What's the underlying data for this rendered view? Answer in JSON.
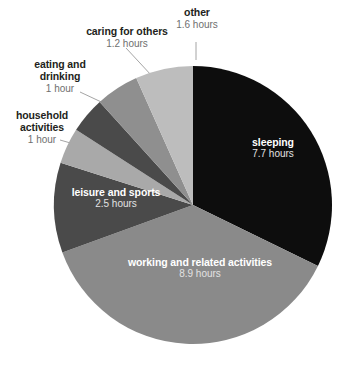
{
  "chart_data": {
    "type": "pie",
    "title": "",
    "subtitle": "",
    "unit": "hours",
    "total_hours": 23.9,
    "legend_position": "none",
    "grid": false,
    "start_angle_deg": 0,
    "direction": "clockwise",
    "categories": [
      "sleeping",
      "working and related activities",
      "leisure and sports",
      "household activities",
      "eating and drinking",
      "caring for others",
      "other"
    ],
    "values": [
      7.7,
      8.9,
      2.5,
      1,
      1,
      1.2,
      1.6
    ],
    "colors": [
      "#0d0d0d",
      "#8a8a8a",
      "#4a4a4a",
      "#a9a9a9",
      "#4a4a4a",
      "#8f8f8f",
      "#bdbdbd"
    ],
    "slices": [
      {
        "name": "sleeping",
        "value_label": "7.7 hours",
        "value": 7.7,
        "color": "#0d0d0d",
        "label_placement": "inside",
        "label_color": "#ffffff"
      },
      {
        "name": "working and related activities",
        "value_label": "8.9 hours",
        "value": 8.9,
        "color": "#8a8a8a",
        "label_placement": "inside",
        "label_color": "#ffffff"
      },
      {
        "name": "leisure and sports",
        "value_label": "2.5 hours",
        "value": 2.5,
        "color": "#4a4a4a",
        "label_placement": "inside",
        "label_color": "#ffffff"
      },
      {
        "name": "household activities",
        "value_label": "1 hour",
        "value": 1,
        "color": "#a9a9a9",
        "label_placement": "outside",
        "label_color": "#231f20"
      },
      {
        "name": "eating and drinking",
        "value_label": "1 hour",
        "value": 1,
        "color": "#4a4a4a",
        "label_placement": "outside",
        "label_color": "#231f20"
      },
      {
        "name": "caring for others",
        "value_label": "1.2 hours",
        "value": 1.2,
        "color": "#8f8f8f",
        "label_placement": "outside",
        "label_color": "#231f20"
      },
      {
        "name": "other",
        "value_label": "1.6 hours",
        "value": 1.6,
        "color": "#bdbdbd",
        "label_placement": "outside",
        "label_color": "#231f20"
      }
    ]
  },
  "labels": {
    "other": {
      "name": "other",
      "value": "1.6 hours"
    },
    "caring": {
      "name": "caring for others",
      "value": "1.2 hours"
    },
    "eating": {
      "name_line1": "eating and",
      "name_line2": "drinking",
      "value": "1 hour"
    },
    "household": {
      "name_line1": "household",
      "name_line2": "activities",
      "value": "1 hour"
    },
    "leisure": {
      "name": "leisure and sports",
      "value": "2.5 hours"
    },
    "working": {
      "name": "working and related activities",
      "value": "8.9 hours"
    },
    "sleeping": {
      "name": "sleeping",
      "value": "7.7 hours"
    }
  }
}
